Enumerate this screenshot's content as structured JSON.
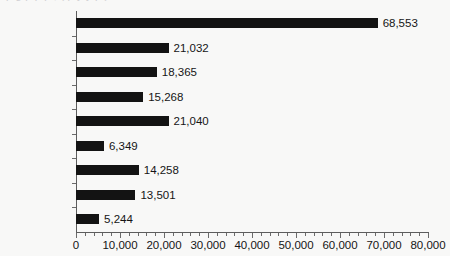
{
  "figure": {
    "clipped_caption_above": "p g p p p , ( p y y p )",
    "background_color": "#f8f8f7",
    "bar_color": "#131313",
    "axis_color": "#5d5d5d",
    "text_color": "#151515"
  },
  "chart_data": {
    "type": "bar",
    "orientation": "horizontal",
    "title": "",
    "subtitle": "",
    "xlabel": "",
    "ylabel": "",
    "grid": false,
    "legend": null,
    "xlim": [
      0,
      80000
    ],
    "categories": [
      "Bicycles",
      "Baseball",
      "Softball",
      "4 wheel ATVs",
      "Swimming",
      "Swing Sets",
      "Fishing",
      "Skateboards",
      "Fireworks"
    ],
    "values": [
      68553,
      21032,
      18365,
      15268,
      21040,
      6349,
      14258,
      13501,
      5244
    ],
    "data_labels": [
      "68,553",
      "21,032",
      "18,365",
      "15,268",
      "21,040",
      "6,349",
      "14,258",
      "13,501",
      "5,244"
    ],
    "xticks": [
      0,
      10000,
      20000,
      30000,
      40000,
      50000,
      60000,
      70000,
      80000
    ],
    "xtick_labels": [
      "0",
      "10,000",
      "20,000",
      "30,000",
      "40,000",
      "50,000",
      "60,000",
      "70,000",
      "80,000"
    ],
    "minor_tick_interval": 2000
  }
}
